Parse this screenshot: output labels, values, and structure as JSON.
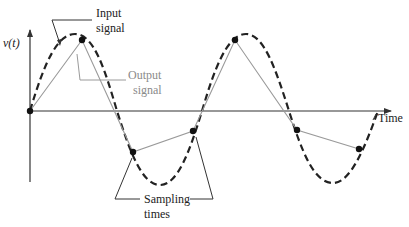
{
  "labels": {
    "y_axis": "v(t)",
    "x_axis": "Time",
    "input_line1": "Input",
    "input_line2": "signal",
    "output_line1": "Output",
    "output_line2": "signal",
    "sampling_line1": "Sampling",
    "sampling_line2": "times"
  },
  "colors": {
    "input_signal": "#222222",
    "output_signal": "#9a9a9a",
    "axes": "#333333",
    "sample_points": "#111111"
  },
  "signals": {
    "input": {
      "style": "dashed",
      "shape": "sine",
      "periods": 2
    },
    "output": {
      "style": "solid",
      "shape": "piecewise-linear through samples"
    }
  },
  "sample_points_px": [
    [
      30,
      111
    ],
    [
      82,
      40
    ],
    [
      133,
      152
    ],
    [
      193,
      131
    ],
    [
      235,
      40
    ],
    [
      297,
      130
    ],
    [
      359,
      149
    ]
  ]
}
